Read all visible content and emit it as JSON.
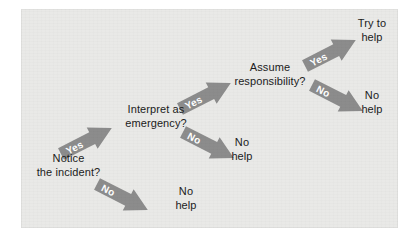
{
  "figure": {
    "panel_color": "#e9e9e7",
    "arrow_color": "#8c8c8c",
    "arrow_label_color": "#ffffff",
    "text_color": "#1b1b1b"
  },
  "nodes": [
    {
      "id": "notice",
      "kind": "question",
      "label": "Notice\nthe incident?"
    },
    {
      "id": "interpret",
      "kind": "question",
      "label": "Interpret as\nemergency?"
    },
    {
      "id": "responsibility",
      "kind": "question",
      "label": "Assume\nresponsibility?"
    },
    {
      "id": "no-help-1",
      "kind": "outcome",
      "label": "No\nhelp"
    },
    {
      "id": "no-help-2",
      "kind": "outcome",
      "label": "No\nhelp"
    },
    {
      "id": "no-help-3",
      "kind": "outcome",
      "label": "No\nhelp"
    },
    {
      "id": "try-to-help",
      "kind": "outcome",
      "label": "Try to\nhelp"
    }
  ],
  "arrows": [
    {
      "id": "notice-yes",
      "label": "Yes",
      "from": "notice",
      "to": "interpret"
    },
    {
      "id": "notice-no",
      "label": "No",
      "from": "notice",
      "to": "no-help-1"
    },
    {
      "id": "interpret-yes",
      "label": "Yes",
      "from": "interpret",
      "to": "responsibility"
    },
    {
      "id": "interpret-no",
      "label": "No",
      "from": "interpret",
      "to": "no-help-2"
    },
    {
      "id": "responsibility-yes",
      "label": "Yes",
      "from": "responsibility",
      "to": "try-to-help"
    },
    {
      "id": "responsibility-no",
      "label": "No",
      "from": "responsibility",
      "to": "no-help-3"
    }
  ]
}
